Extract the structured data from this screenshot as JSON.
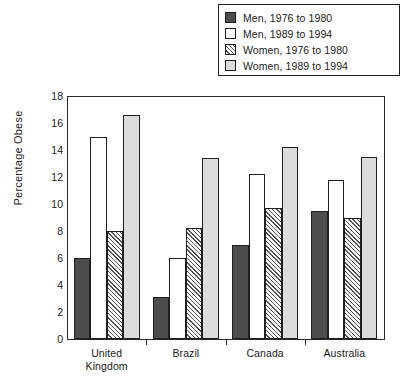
{
  "chart_data": {
    "type": "bar",
    "title": "",
    "xlabel": "",
    "ylabel": "Percentage Obese",
    "ylim": [
      0,
      18
    ],
    "ytick_step": 2,
    "yticks": [
      0,
      2,
      4,
      6,
      8,
      10,
      12,
      14,
      16,
      18
    ],
    "grid": false,
    "legend_position": "top-right",
    "categories": [
      "United Kingdom",
      "Brazil",
      "Canada",
      "Australia"
    ],
    "category_lines": [
      [
        "United",
        "Kingdom"
      ],
      [
        "Brazil"
      ],
      [
        "Canada"
      ],
      [
        "Australia"
      ]
    ],
    "series": [
      {
        "name": "Men, 1976 to 1980",
        "key": "men76",
        "fill": "#4d4d4d",
        "values": [
          6.0,
          3.1,
          7.0,
          9.5
        ]
      },
      {
        "name": "Men, 1989 to 1994",
        "key": "men89",
        "fill": "#ffffff",
        "values": [
          15.0,
          6.0,
          12.2,
          11.8
        ]
      },
      {
        "name": "Women, 1976 to 1980",
        "key": "wom76",
        "fill": "hatched",
        "values": [
          8.0,
          8.2,
          9.7,
          9.0
        ]
      },
      {
        "name": "Women, 1989 to 1994",
        "key": "wom89",
        "fill": "#dcdcdc",
        "values": [
          16.6,
          13.4,
          14.2,
          13.5
        ]
      }
    ]
  },
  "legend": {
    "items": [
      {
        "label": "Men, 1976 to 1980",
        "swatch": "men76"
      },
      {
        "label": "Men, 1989 to 1994",
        "swatch": "men89"
      },
      {
        "label": "Women, 1976 to 1980",
        "swatch": "wom76"
      },
      {
        "label": "Women, 1989 to 1994",
        "swatch": "wom89"
      }
    ]
  },
  "axis": {
    "y_title": "Percentage Obese",
    "y_labels": [
      "18",
      "16",
      "14",
      "12",
      "10",
      "8",
      "6",
      "4",
      "2",
      "0"
    ]
  }
}
